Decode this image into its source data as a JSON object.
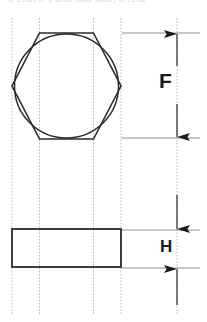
{
  "drawing": {
    "title": "Hex bolt head dimension drawing",
    "top_partial_text": "a chaco s and ana mar, a rcia",
    "stroke_color": "#2b2b2b",
    "centerline_color": "#b8b8b8",
    "extension_line_color": "#999999",
    "background": "#ffffff",
    "canvas": {
      "width": 207,
      "height": 322
    }
  },
  "views": {
    "top_view": {
      "name": "hexagon-head-top-view",
      "hexagon": {
        "center_x": 66.5,
        "center_y": 86,
        "flat_half_height": 53,
        "vertex_half_width": 54.5,
        "top_flat_y": 33,
        "bottom_flat_y": 139,
        "left_vertex_x": 12,
        "right_vertex_x": 121,
        "flat_left_x": 39.5,
        "flat_right_x": 93.5
      },
      "circle": {
        "center_x": 66.5,
        "center_y": 86,
        "radius": 52
      }
    },
    "side_view": {
      "name": "head-side-view-rectangle",
      "x": 12,
      "y": 229,
      "width": 109,
      "height": 38
    }
  },
  "centerlines": [
    {
      "name": "centerline-1",
      "x": 12
    },
    {
      "name": "centerline-2",
      "x": 39.5
    },
    {
      "name": "centerline-3",
      "x": 93.5
    },
    {
      "name": "centerline-4",
      "x": 121
    },
    {
      "name": "centerline-5",
      "x": 177
    }
  ],
  "dimensions": [
    {
      "id": "F",
      "label": "F",
      "meaning": "width-across-flats",
      "arrow_x": 177,
      "top_y": 33,
      "bottom_y": 138,
      "extension_line_left_x": 122,
      "extension_line_right_x": 200,
      "arrow_direction": "inward-pair"
    },
    {
      "id": "H",
      "label": "H",
      "meaning": "head-height",
      "arrow_x": 177,
      "top_y": 230,
      "bottom_y": 268,
      "extension_line_left_x": 122,
      "extension_line_right_x": 200,
      "arrow_direction": "outward-pair"
    }
  ]
}
